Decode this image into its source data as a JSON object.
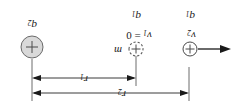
{
  "figure": {
    "name": "two-charge-electrostatics-diagram",
    "orientation": "rotated-180",
    "background_color": "#ffffff",
    "stroke_color": "#3a3a3a",
    "fill_gray": "#d9d9d9"
  },
  "dimensions": [
    {
      "id": "r2",
      "label": "r",
      "sub": "2",
      "span": "outer",
      "arrow": "double"
    },
    {
      "id": "r1",
      "label": "r",
      "sub": "1",
      "span": "inner",
      "arrow": "double"
    }
  ],
  "charges": [
    {
      "id": "charge-left-small",
      "sign": "+",
      "style": "solid-outline",
      "label": "q",
      "sub": "1",
      "velocity_label": "v",
      "velocity_sub": "2",
      "velocity_value": ""
    },
    {
      "id": "charge-center-dashed",
      "sign": "+",
      "style": "dashed-outline",
      "mass_label": "m",
      "label": "q",
      "sub": "1",
      "velocity_label": "v",
      "velocity_sub": "1",
      "velocity_value": "= 0"
    },
    {
      "id": "charge-right-large",
      "sign": "+",
      "style": "filled-gray",
      "label": "q",
      "sub": "2"
    }
  ],
  "labels": {
    "r2": "r",
    "r2_sub": "2",
    "r1": "r",
    "r1_sub": "1",
    "m": "m",
    "v2": "v",
    "v2_sub": "2",
    "v1": "v",
    "v1_sub": "1",
    "v1_value": "= 0",
    "q1_left": "q",
    "q1_left_sub": "1",
    "q1_center": "q",
    "q1_center_sub": "1",
    "q2": "q",
    "q2_sub": "2"
  },
  "velocity_arrow": {
    "id": "velocity-arrow-left",
    "direction": "left",
    "from_x": 42,
    "to_x": 10
  }
}
